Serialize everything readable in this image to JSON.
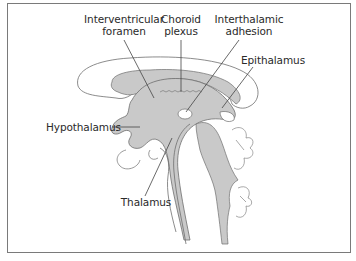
{
  "diagram": {
    "type": "anatomical-illustration",
    "colors": {
      "frame": "#7a7a7a",
      "outline": "#6e6e6e",
      "shaded_region": "#c9c9c9",
      "light_region": "#ffffff",
      "leader_line": "#444444",
      "text": "#2a2a2a"
    }
  },
  "labels": {
    "interventricular_foramen": {
      "line1": "Interventricular",
      "line2": "foramen"
    },
    "choroid_plexus": {
      "line1": "Choroid",
      "line2": "plexus"
    },
    "interthalamic_adhesion": {
      "line1": "Interthalamic",
      "line2": "adhesion"
    },
    "epithalamus": {
      "line1": "Epithalamus"
    },
    "hypothalamus": {
      "line1": "Hypothalamus"
    },
    "thalamus": {
      "line1": "Thalamus"
    }
  }
}
